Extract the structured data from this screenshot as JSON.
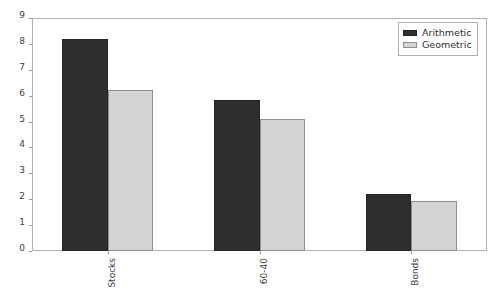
{
  "chart_data": {
    "type": "bar",
    "title": "",
    "xlabel": "",
    "ylabel": "",
    "categories": [
      "Stocks",
      "60-40",
      "Bonds"
    ],
    "series": [
      {
        "name": "Arithmetic",
        "color": "#2e2e2e",
        "values": [
          8.2,
          5.85,
          2.2
        ]
      },
      {
        "name": "Geometric",
        "color": "#d4d4d4",
        "values": [
          6.2,
          5.1,
          1.95
        ]
      }
    ],
    "ylim": [
      0,
      9
    ],
    "yticks": [
      0,
      1,
      2,
      3,
      4,
      5,
      6,
      7,
      8,
      9
    ],
    "ytick_labels": [
      "0",
      "1",
      "2",
      "3",
      "4",
      "5",
      "6",
      "7",
      "8",
      "9"
    ],
    "xtick_label_rotation": 90,
    "grid": false,
    "legend_position": "upper right",
    "frame": true,
    "background_color": "#ffffff"
  }
}
